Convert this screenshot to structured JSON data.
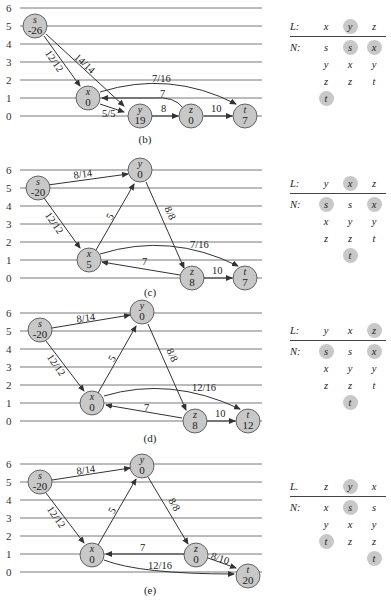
{
  "panels": [
    {
      "caption": "(b)",
      "y_ticks": [
        "6",
        "5",
        "4",
        "3",
        "2",
        "1",
        "0"
      ],
      "nodes": [
        {
          "id": "s",
          "label": "s",
          "value": "-26",
          "height": 5
        },
        {
          "id": "x",
          "label": "x",
          "value": "0",
          "height": 1
        },
        {
          "id": "y",
          "label": "y",
          "value": "19",
          "height": 0
        },
        {
          "id": "z",
          "label": "z",
          "value": "0",
          "height": 0
        },
        {
          "id": "t",
          "label": "t",
          "value": "7",
          "height": 0
        }
      ],
      "edges": [
        {
          "from": "s",
          "to": "x",
          "label": "12/12"
        },
        {
          "from": "s",
          "to": "y",
          "label": "14/14"
        },
        {
          "from": "x",
          "to": "y",
          "label": "5/5"
        },
        {
          "from": "x",
          "to": "t",
          "label": "7/16"
        },
        {
          "from": "z",
          "to": "x",
          "label": "7"
        },
        {
          "from": "y",
          "to": "z",
          "label": "8"
        },
        {
          "from": "z",
          "to": "t",
          "label": "10"
        }
      ],
      "table": {
        "L_label": "L:",
        "N_label": "N:",
        "L": [
          {
            "v": "x",
            "hl": false
          },
          {
            "v": "y",
            "hl": true
          },
          {
            "v": "z",
            "hl": false
          }
        ],
        "N": [
          [
            {
              "v": "s",
              "hl": false
            },
            {
              "v": "y",
              "hl": false
            },
            {
              "v": "z",
              "hl": false
            },
            {
              "v": "t",
              "hl": true
            }
          ],
          [
            {
              "v": "s",
              "hl": true
            },
            {
              "v": "x",
              "hl": false
            },
            {
              "v": "z",
              "hl": false
            }
          ],
          [
            {
              "v": "x",
              "hl": true
            },
            {
              "v": "y",
              "hl": false
            },
            {
              "v": "t",
              "hl": false
            }
          ]
        ]
      }
    },
    {
      "caption": "(c)",
      "y_ticks": [
        "6",
        "5",
        "4",
        "3",
        "2",
        "1",
        "0"
      ],
      "nodes": [
        {
          "id": "s",
          "label": "s",
          "value": "-20",
          "height": 5
        },
        {
          "id": "y",
          "label": "y",
          "value": "0",
          "height": 6
        },
        {
          "id": "x",
          "label": "x",
          "value": "5",
          "height": 1
        },
        {
          "id": "z",
          "label": "z",
          "value": "8",
          "height": 0
        },
        {
          "id": "t",
          "label": "t",
          "value": "7",
          "height": 0
        }
      ],
      "edges": [
        {
          "from": "s",
          "to": "y",
          "label": "8/14"
        },
        {
          "from": "s",
          "to": "x",
          "label": "12/12"
        },
        {
          "from": "x",
          "to": "y",
          "label": "5"
        },
        {
          "from": "y",
          "to": "z",
          "label": "8/8"
        },
        {
          "from": "x",
          "to": "t",
          "label": "7/16"
        },
        {
          "from": "z",
          "to": "x",
          "label": "7"
        },
        {
          "from": "z",
          "to": "t",
          "label": "10"
        }
      ],
      "table": {
        "L_label": "L:",
        "N_label": "N:",
        "L": [
          {
            "v": "y",
            "hl": false
          },
          {
            "v": "x",
            "hl": true
          },
          {
            "v": "z",
            "hl": false
          }
        ],
        "N": [
          [
            {
              "v": "s",
              "hl": true
            },
            {
              "v": "x",
              "hl": false
            },
            {
              "v": "z",
              "hl": false
            }
          ],
          [
            {
              "v": "s",
              "hl": false
            },
            {
              "v": "y",
              "hl": false
            },
            {
              "v": "z",
              "hl": false
            },
            {
              "v": "t",
              "hl": true
            }
          ],
          [
            {
              "v": "x",
              "hl": true
            },
            {
              "v": "y",
              "hl": false
            },
            {
              "v": "t",
              "hl": false
            }
          ]
        ]
      }
    },
    {
      "caption": "(d)",
      "y_ticks": [
        "6",
        "5",
        "4",
        "3",
        "2",
        "1",
        "0"
      ],
      "nodes": [
        {
          "id": "s",
          "label": "s",
          "value": "-20",
          "height": 5
        },
        {
          "id": "y",
          "label": "y",
          "value": "0",
          "height": 6
        },
        {
          "id": "x",
          "label": "x",
          "value": "0",
          "height": 1
        },
        {
          "id": "z",
          "label": "z",
          "value": "8",
          "height": 0
        },
        {
          "id": "t",
          "label": "t",
          "value": "12",
          "height": 0
        }
      ],
      "edges": [
        {
          "from": "s",
          "to": "y",
          "label": "8/14"
        },
        {
          "from": "s",
          "to": "x",
          "label": "12/12"
        },
        {
          "from": "x",
          "to": "y",
          "label": "5"
        },
        {
          "from": "y",
          "to": "z",
          "label": "8/8"
        },
        {
          "from": "x",
          "to": "t",
          "label": "12/16"
        },
        {
          "from": "z",
          "to": "x",
          "label": "7"
        },
        {
          "from": "z",
          "to": "t",
          "label": "10"
        }
      ],
      "table": {
        "L_label": "L:",
        "N_label": "N:",
        "L": [
          {
            "v": "y",
            "hl": false
          },
          {
            "v": "x",
            "hl": false
          },
          {
            "v": "z",
            "hl": true
          }
        ],
        "N": [
          [
            {
              "v": "s",
              "hl": true
            },
            {
              "v": "x",
              "hl": false
            },
            {
              "v": "z",
              "hl": false
            }
          ],
          [
            {
              "v": "s",
              "hl": false
            },
            {
              "v": "y",
              "hl": false
            },
            {
              "v": "z",
              "hl": false
            },
            {
              "v": "t",
              "hl": true
            }
          ],
          [
            {
              "v": "x",
              "hl": true
            },
            {
              "v": "y",
              "hl": false
            },
            {
              "v": "t",
              "hl": false
            }
          ]
        ]
      }
    },
    {
      "caption": "(e)",
      "y_ticks": [
        "6",
        "5",
        "4",
        "3",
        "2",
        "1",
        "0"
      ],
      "nodes": [
        {
          "id": "s",
          "label": "s",
          "value": "-20",
          "height": 5
        },
        {
          "id": "y",
          "label": "y",
          "value": "0",
          "height": 6
        },
        {
          "id": "x",
          "label": "x",
          "value": "0",
          "height": 1
        },
        {
          "id": "z",
          "label": "z",
          "value": "0",
          "height": 1
        },
        {
          "id": "t",
          "label": "t",
          "value": "20",
          "height": 0
        }
      ],
      "edges": [
        {
          "from": "s",
          "to": "y",
          "label": "8/14"
        },
        {
          "from": "s",
          "to": "x",
          "label": "12/12"
        },
        {
          "from": "x",
          "to": "y",
          "label": "5"
        },
        {
          "from": "y",
          "to": "z",
          "label": "8/8"
        },
        {
          "from": "z",
          "to": "x",
          "label": "7"
        },
        {
          "from": "x",
          "to": "t",
          "label": "12/16"
        },
        {
          "from": "z",
          "to": "t",
          "label": "8/10"
        }
      ],
      "table": {
        "L_label": "L.",
        "N_label": "N:",
        "L": [
          {
            "v": "z",
            "hl": false
          },
          {
            "v": "y",
            "hl": true
          },
          {
            "v": "x",
            "hl": false
          }
        ],
        "N": [
          [
            {
              "v": "x",
              "hl": false
            },
            {
              "v": "y",
              "hl": false
            },
            {
              "v": "t",
              "hl": true
            }
          ],
          [
            {
              "v": "s",
              "hl": true
            },
            {
              "v": "x",
              "hl": false
            },
            {
              "v": "z",
              "hl": false
            }
          ],
          [
            {
              "v": "s",
              "hl": false
            },
            {
              "v": "y",
              "hl": false
            },
            {
              "v": "z",
              "hl": false
            },
            {
              "v": "t",
              "hl": true
            }
          ]
        ]
      }
    }
  ]
}
